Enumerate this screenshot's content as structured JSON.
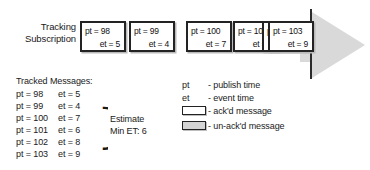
{
  "timeline": {
    "label_line1": "Tracking",
    "label_line2": "Subscription",
    "boxes": [
      {
        "pt": "pt = 98",
        "et": "et = 5",
        "state": "ack"
      },
      {
        "pt": "pt = 99",
        "et": "et = 4",
        "state": "ack"
      },
      {
        "pt": "pt = 100",
        "et": "et = 7",
        "state": "ack"
      },
      {
        "pt": "pt = 101",
        "et": "et = 6",
        "state": "ack"
      },
      {
        "pt": "pt = 102",
        "et": "et = 8",
        "state": "ack"
      },
      {
        "pt": "pt = 103",
        "et": "et = 9",
        "state": "ack"
      }
    ]
  },
  "tracked": {
    "title": "Tracked Messages:",
    "rows": [
      {
        "pt": "pt = 98",
        "et": "et = 5"
      },
      {
        "pt": "pt = 99",
        "et": "et = 4"
      },
      {
        "pt": "pt = 100",
        "et": "et = 7"
      },
      {
        "pt": "pt = 101",
        "et": "et = 6"
      },
      {
        "pt": "pt = 102",
        "et": "et = 8"
      },
      {
        "pt": "pt = 103",
        "et": "et = 9"
      }
    ],
    "brace_glyph": "}",
    "estimate_line1": "Estimate",
    "estimate_line2": "Min ET: 6"
  },
  "legend": {
    "rows": [
      {
        "key": "pt",
        "desc": "- publish time"
      },
      {
        "key": "et",
        "desc": "- event time"
      }
    ],
    "swatches": [
      {
        "desc": "- ack'd message",
        "fill": "#ffffff"
      },
      {
        "desc": "- un-ack'd message",
        "fill": "#d4d4d4"
      }
    ]
  },
  "colors": {
    "box_border": "#232323",
    "arrow_fill": "#d9d9d9",
    "marker": "#2b2b2b",
    "background": "#ffffff"
  }
}
